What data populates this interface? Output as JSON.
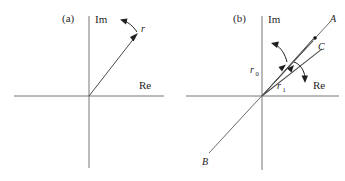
{
  "figure": {
    "background_color": "#ffffff",
    "ink_color": "#1a1a1a",
    "axis_color": "#767676"
  },
  "panels": [
    {
      "id": "a",
      "label": "(a)",
      "axes": {
        "imaginary_label": "Im",
        "real_label": "Re"
      },
      "vectors": [
        {
          "name": "r",
          "label": "r",
          "subscript": "",
          "from": "origin",
          "to": "upper-right",
          "has_arrowhead": true
        }
      ],
      "rotation_arrows": [
        {
          "name": "rotation-arrow-r",
          "direction": "counter-clockwise",
          "points_to": "upper-left"
        }
      ]
    },
    {
      "id": "b",
      "label": "(b)",
      "axes": {
        "imaginary_label": "Im",
        "real_label": "Re"
      },
      "points": [
        {
          "name": "A",
          "label": "A",
          "position": "upper-right-outer"
        },
        {
          "name": "B",
          "label": "B",
          "position": "lower-left-outer"
        },
        {
          "name": "C",
          "label": "C",
          "position": "upper-right-inner"
        }
      ],
      "vectors": [
        {
          "name": "r0",
          "label": "r",
          "subscript": "0",
          "from": "origin",
          "to": "point-C",
          "has_arrowhead": true
        },
        {
          "name": "r1",
          "label": "r",
          "subscript": "1",
          "from": "origin",
          "to": "point-C",
          "has_arrowhead": true
        }
      ],
      "rotation_arrows": [
        {
          "name": "rotation-arrow-r0",
          "direction": "counter-clockwise",
          "points_to": "upper-left"
        },
        {
          "name": "rotation-arrow-r1",
          "direction": "clockwise",
          "points_to": "lower-right"
        }
      ],
      "line_AB": {
        "name": "line-A-B",
        "from_label": "B",
        "to_label": "A",
        "description": "straight line through origin"
      }
    }
  ]
}
